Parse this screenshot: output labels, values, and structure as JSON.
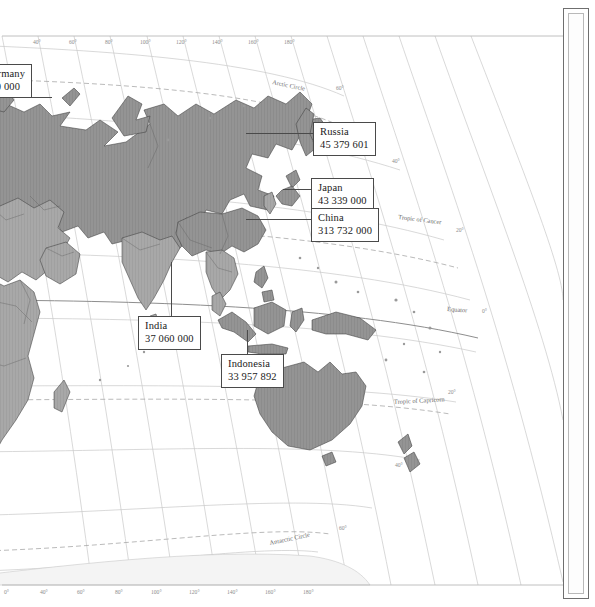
{
  "figure": {
    "name": "world-map-asia-pacific",
    "projection_note": "curved graticule world map, Asia-Pacific sheet"
  },
  "map": {
    "land_color": "#8f8f8f",
    "ocean_color": "#ffffff",
    "border_color": "#3a3a3a",
    "graticule_color": "#c2c2c2",
    "reference_line_color": "#9a9a9a"
  },
  "reference_lines": [
    {
      "id": "arctic-circle",
      "label": "Arctic Circle"
    },
    {
      "id": "tropic-of-cancer",
      "label": "Tropic of Cancer"
    },
    {
      "id": "equator",
      "label": "Equator"
    },
    {
      "id": "tropic-of-capricorn",
      "label": "Tropic of Capricorn"
    },
    {
      "id": "antarctic-circle",
      "label": "Antarctic Circle"
    }
  ],
  "longitude_ticks_top": [
    {
      "label": "40°",
      "x": 38
    },
    {
      "label": "60°",
      "x": 74
    },
    {
      "label": "80°",
      "x": 110
    },
    {
      "label": "100°",
      "x": 147
    },
    {
      "label": "120°",
      "x": 183
    },
    {
      "label": "140°",
      "x": 219
    },
    {
      "label": "160°",
      "x": 255
    },
    {
      "label": "180°",
      "x": 291
    }
  ],
  "longitude_ticks_bottom": [
    {
      "label": "0°",
      "x": 8
    },
    {
      "label": "40°",
      "x": 45
    },
    {
      "label": "60°",
      "x": 82
    },
    {
      "label": "80°",
      "x": 120
    },
    {
      "label": "100°",
      "x": 158
    },
    {
      "label": "120°",
      "x": 196
    },
    {
      "label": "140°",
      "x": 234
    },
    {
      "label": "160°",
      "x": 272
    },
    {
      "label": "180°",
      "x": 310
    }
  ],
  "latitude_ticks": [
    {
      "label": "60°",
      "x": 340,
      "y": 88
    },
    {
      "label": "40°",
      "x": 396,
      "y": 161
    },
    {
      "label": "20°",
      "x": 460,
      "y": 230
    },
    {
      "label": "0°",
      "x": 486,
      "y": 311
    },
    {
      "label": "20°",
      "x": 452,
      "y": 392
    },
    {
      "label": "40°",
      "x": 399,
      "y": 465
    },
    {
      "label": "60°",
      "x": 343,
      "y": 528
    }
  ],
  "callouts": [
    {
      "id": "germany",
      "name": "Germany",
      "value": "700 000",
      "clipped_left": true
    },
    {
      "id": "russia",
      "name": "Russia",
      "value": "45 379 601"
    },
    {
      "id": "japan",
      "name": "Japan",
      "value": "43 339 000"
    },
    {
      "id": "china",
      "name": "China",
      "value": "313 732 000"
    },
    {
      "id": "india",
      "name": "India",
      "value": "37 060 000"
    },
    {
      "id": "indonesia",
      "name": "Indonesia",
      "value": "33 957 892"
    }
  ]
}
